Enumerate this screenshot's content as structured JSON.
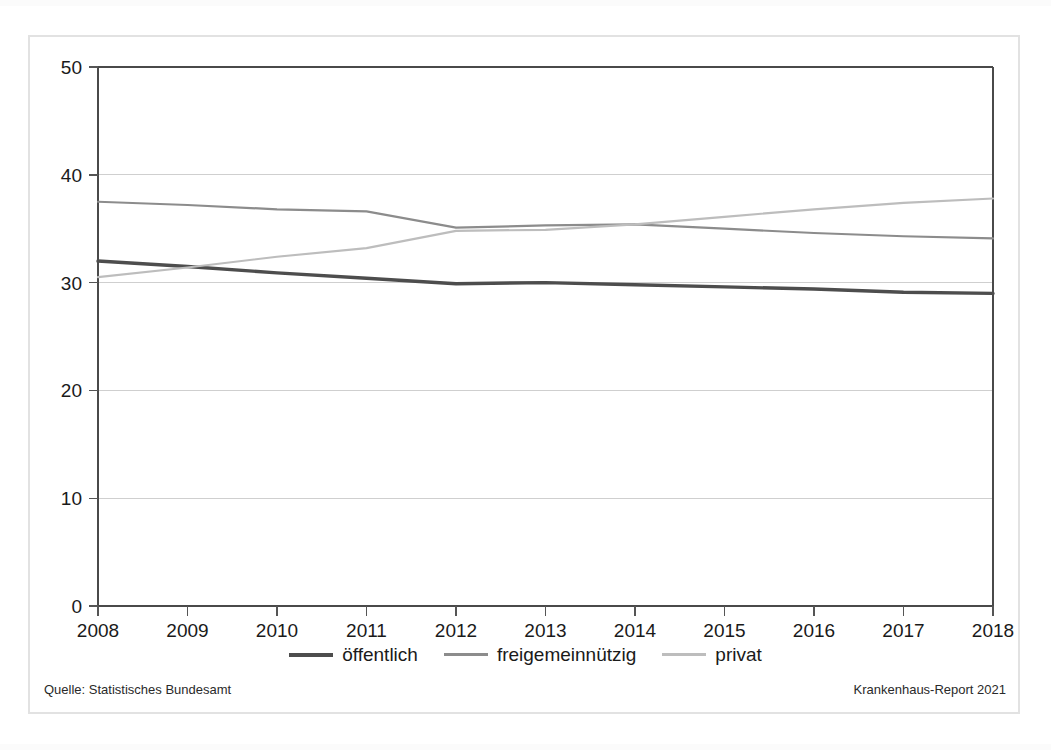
{
  "figure": {
    "source_note": "Quelle: Statistisches Bundesamt",
    "report_note": "Krankenhaus-Report 2021"
  },
  "legend": {
    "items": [
      {
        "label": "öffentlich",
        "color": "#4d4d4d"
      },
      {
        "label": "freigemeinnützig",
        "color": "#8c8c8c"
      },
      {
        "label": "privat",
        "color": "#bdbdbd"
      }
    ]
  },
  "axis": {
    "y_ticks": [
      "0",
      "10",
      "20",
      "30",
      "40",
      "50"
    ],
    "x_ticks": [
      "2008",
      "2009",
      "2010",
      "2011",
      "2012",
      "2013",
      "2014",
      "2015",
      "2016",
      "2017",
      "2018"
    ]
  },
  "chart_data": {
    "type": "line",
    "title": "",
    "subtitle": "",
    "xlabel": "",
    "ylabel": "",
    "categories": [
      2008,
      2009,
      2010,
      2011,
      2012,
      2013,
      2014,
      2015,
      2016,
      2017,
      2018
    ],
    "x": [
      2008,
      2009,
      2010,
      2011,
      2012,
      2013,
      2014,
      2015,
      2016,
      2017,
      2018
    ],
    "xlim": [
      2008,
      2018
    ],
    "ylim": [
      0,
      50
    ],
    "ytick_step": 10,
    "grid": "horizontal",
    "legend_position": "bottom-center",
    "series": [
      {
        "name": "öffentlich",
        "color": "#4d4d4d",
        "width": 3.4,
        "values": [
          32.0,
          31.5,
          30.9,
          30.4,
          29.9,
          30.0,
          29.8,
          29.6,
          29.4,
          29.1,
          29.0
        ]
      },
      {
        "name": "freigemeinnützig",
        "color": "#8c8c8c",
        "width": 2.2,
        "values": [
          37.5,
          37.2,
          36.8,
          36.6,
          35.1,
          35.3,
          35.4,
          35.0,
          34.6,
          34.3,
          34.1
        ]
      },
      {
        "name": "privat",
        "color": "#bdbdbd",
        "width": 2.2,
        "values": [
          30.5,
          31.4,
          32.4,
          33.2,
          34.8,
          34.9,
          35.4,
          36.1,
          36.8,
          37.4,
          37.8
        ]
      }
    ]
  },
  "plot_geometry": {
    "left": 98,
    "right": 993,
    "top": 67,
    "bottom": 606
  }
}
